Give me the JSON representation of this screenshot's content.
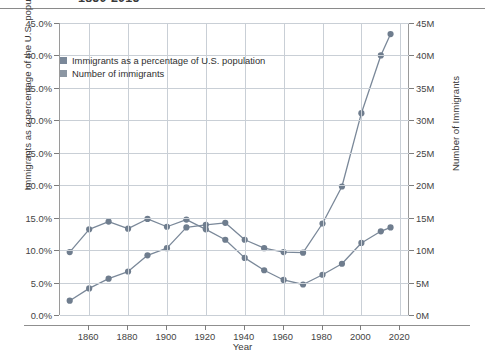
{
  "chart_data": {
    "type": "line",
    "title": "1850-2015",
    "xlabel": "Year",
    "ylabel": "Immigrants as a percentage of the U.S. population",
    "ylabel_right": "Number of Immigrants",
    "x": [
      1850,
      1860,
      1870,
      1880,
      1890,
      1900,
      1910,
      1920,
      1930,
      1940,
      1950,
      1960,
      1970,
      1980,
      1990,
      2000,
      2010,
      2015
    ],
    "xlim": [
      1845,
      2025
    ],
    "xticks": [
      1860,
      1880,
      1900,
      1920,
      1940,
      1960,
      1980,
      2000,
      2020
    ],
    "xticklabels": [
      "1860",
      "1880",
      "1900",
      "1920",
      "1940",
      "1960",
      "1980",
      "2000",
      "2020"
    ],
    "ylim": [
      0,
      45
    ],
    "yticks": [
      0,
      5,
      10,
      15,
      20,
      25,
      30,
      35,
      40,
      45
    ],
    "yticklabels": [
      "0.0%",
      "5.0%",
      "10.0%",
      "15.0%",
      "20.0%",
      "25.0%",
      "30.0%",
      "35.0%",
      "40.0%",
      "45.0%"
    ],
    "ylim_right": [
      0,
      45
    ],
    "yticks_right": [
      0,
      5,
      10,
      15,
      20,
      25,
      30,
      35,
      40,
      45
    ],
    "yticklabels_right": [
      "0M",
      "5M",
      "10M",
      "15M",
      "20M",
      "25M",
      "30M",
      "35M",
      "40M",
      "45M"
    ],
    "grid": true,
    "legend_position": "upper-left",
    "series": [
      {
        "name": "Immigrants as a percentage of U.S. population",
        "axis": "left",
        "unit": "percent",
        "color": "#7a8899",
        "values": [
          9.7,
          13.2,
          14.4,
          13.3,
          14.8,
          13.6,
          14.7,
          13.2,
          11.6,
          8.8,
          6.9,
          5.4,
          4.7,
          6.2,
          7.9,
          11.1,
          12.9,
          13.5
        ]
      },
      {
        "name": "Number of immigrants",
        "axis": "right",
        "unit": "millions",
        "color": "#7a8899",
        "values": [
          2.2,
          4.1,
          5.6,
          6.7,
          9.2,
          10.3,
          13.5,
          13.9,
          14.2,
          11.6,
          10.3,
          9.7,
          9.6,
          14.1,
          19.8,
          31.1,
          40.0,
          43.3
        ]
      }
    ]
  },
  "legend": {
    "items": [
      {
        "label": "Immigrants as a percentage of U.S. population",
        "color": "#7a8899"
      },
      {
        "label": "Number of immigrants",
        "color": "#8b96a3"
      }
    ]
  },
  "style": {
    "grid_color": "#c9cfd6",
    "axis_color": "#8f8f8f",
    "text_color": "#3a3a3a",
    "line_color": "#7a8899",
    "marker_color": "#6f7d8e",
    "background": "#ffffff"
  }
}
